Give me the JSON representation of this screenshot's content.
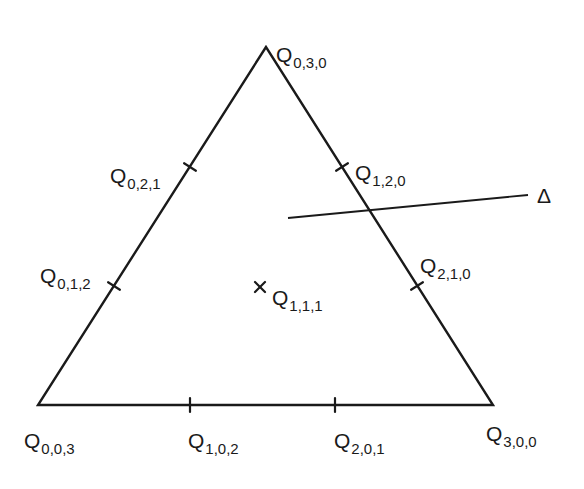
{
  "diagram": {
    "triangle": {
      "vertices": [
        {
          "id": "Q030",
          "x": 266,
          "y": 47
        },
        {
          "id": "Q003",
          "x": 38,
          "y": 405
        },
        {
          "id": "Q300",
          "x": 493,
          "y": 405
        }
      ]
    },
    "points": [
      {
        "id": "Q030",
        "base": "Q",
        "sub": "0,3,0",
        "kind": "vertex",
        "px": 266,
        "py": 47,
        "lx": 276,
        "ly": 62
      },
      {
        "id": "Q021",
        "base": "Q",
        "sub": "0,2,1",
        "kind": "edge-tick",
        "px": 190,
        "py": 167,
        "lx": 110,
        "ly": 183
      },
      {
        "id": "Q012",
        "base": "Q",
        "sub": "0,1,2",
        "kind": "edge-tick",
        "px": 114,
        "py": 286,
        "lx": 40,
        "ly": 283
      },
      {
        "id": "Q120",
        "base": "Q",
        "sub": "1,2,0",
        "kind": "edge-tick",
        "px": 342,
        "py": 167,
        "lx": 355,
        "ly": 180
      },
      {
        "id": "Q210",
        "base": "Q",
        "sub": "2,1,0",
        "kind": "edge-tick",
        "px": 417,
        "py": 286,
        "lx": 420,
        "ly": 273
      },
      {
        "id": "Q111",
        "base": "Q",
        "sub": "1,1,1",
        "kind": "interior-cross",
        "px": 260,
        "py": 287,
        "lx": 272,
        "ly": 305
      },
      {
        "id": "Q003",
        "base": "Q",
        "sub": "0,0,3",
        "kind": "vertex",
        "px": 38,
        "py": 405,
        "lx": 24,
        "ly": 448
      },
      {
        "id": "Q102",
        "base": "Q",
        "sub": "1,0,2",
        "kind": "edge-tick",
        "px": 190,
        "py": 405,
        "lx": 188,
        "ly": 448
      },
      {
        "id": "Q201",
        "base": "Q",
        "sub": "2,0,1",
        "kind": "edge-tick",
        "px": 335,
        "py": 405,
        "lx": 334,
        "ly": 448
      },
      {
        "id": "Q300",
        "base": "Q",
        "sub": "3,0,0",
        "kind": "vertex",
        "px": 493,
        "py": 405,
        "lx": 486,
        "ly": 441
      }
    ],
    "line_delta": {
      "label": "Δ",
      "x1": 288,
      "y1": 218,
      "x2": 528,
      "y2": 195,
      "lx": 537,
      "ly": 203
    },
    "colors": {
      "ink": "#1a1a1a",
      "background": "#ffffff"
    }
  }
}
